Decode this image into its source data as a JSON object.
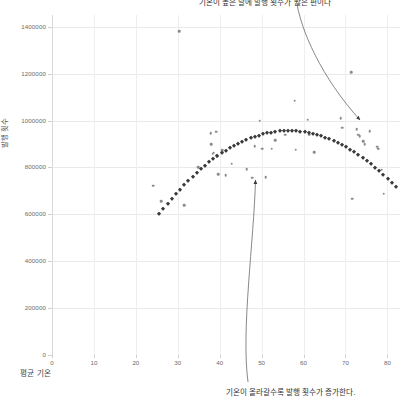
{
  "chart_data": {
    "type": "scatter",
    "title": "기온이 높은 달에 발행 횟수가 많은 편이다",
    "xlabel": "평균 기온",
    "ylabel": "발행 횟수",
    "xlim": [
      0,
      83
    ],
    "ylim": [
      0,
      1450000
    ],
    "grid": true,
    "legend": "none",
    "xticks": [
      0,
      10,
      20,
      30,
      40,
      50,
      60,
      70,
      80
    ],
    "yticks": [
      0,
      200000,
      400000,
      600000,
      800000,
      1000000,
      1200000,
      1400000
    ],
    "ytick_labels": [
      "0",
      "200000",
      "400000",
      "600000",
      "800000",
      "1000000",
      "1200000",
      "1400000"
    ],
    "xtick_labels": [
      "0",
      "10",
      "20",
      "30",
      "40",
      "50",
      "60",
      "70",
      "80"
    ],
    "series": [
      {
        "name": "관측값",
        "type": "scatter",
        "color": "#8b8b8b",
        "marker": "circle",
        "points": [
          [
            24.2,
            722000
          ],
          [
            26.0,
            655000
          ],
          [
            30.3,
            1380000
          ],
          [
            31.6,
            638000
          ],
          [
            34.8,
            800000
          ],
          [
            37.9,
            945000
          ],
          [
            38.0,
            898000
          ],
          [
            38.3,
            858000
          ],
          [
            38.6,
            862000
          ],
          [
            39.1,
            952000
          ],
          [
            39.4,
            848000
          ],
          [
            39.6,
            772000
          ],
          [
            40.6,
            874000
          ],
          [
            41.4,
            766000
          ],
          [
            42.9,
            816000
          ],
          [
            46.4,
            793000
          ],
          [
            47.8,
            756000
          ],
          [
            48.3,
            890000
          ],
          [
            49.5,
            1000000
          ],
          [
            50.2,
            880000
          ],
          [
            51.0,
            757000
          ],
          [
            52.4,
            880000
          ],
          [
            53.2,
            916000
          ],
          [
            55.6,
            940000
          ],
          [
            57.9,
            1085000
          ],
          [
            58.1,
            876000
          ],
          [
            61.0,
            1003000
          ],
          [
            61.3,
            940000
          ],
          [
            62.5,
            866000
          ],
          [
            68.9,
            1011000
          ],
          [
            69.2,
            970000
          ],
          [
            71.4,
            1205000
          ],
          [
            71.6,
            666000
          ],
          [
            72.7,
            963000
          ],
          [
            73.0,
            940000
          ],
          [
            73.4,
            932000
          ],
          [
            74.2,
            912000
          ],
          [
            74.6,
            898000
          ],
          [
            75.8,
            955000
          ],
          [
            77.6,
            888000
          ],
          [
            77.8,
            880000
          ],
          [
            78.6,
            790000
          ],
          [
            79.1,
            688000
          ]
        ]
      },
      {
        "name": "추세선 (2차 회귀)",
        "type": "quadratic-fit",
        "color": "#3a3a3a",
        "marker": "diamond",
        "vertex": [
          56.5,
          955000
        ],
        "x_start": 25.6,
        "x_end": 82.0,
        "n_markers": 58,
        "curvature": -370
      }
    ],
    "annotations": [
      {
        "name": "top-annotation",
        "text": "기온이 높은 달에 발행 횟수가 많은 편이다",
        "target_point": [
          74.0,
          965000
        ],
        "clipped_at_top": true
      },
      {
        "name": "bottom-annotation",
        "text": "기온이 올라갈수록 발행 횟수가 증가한다.",
        "target_point": [
          48.0,
          755000
        ]
      }
    ]
  },
  "colors": {
    "background": "#ffffff",
    "grid": "#e9e9e9",
    "axis": "#d8d8d8",
    "scatter": "#8b8b8b",
    "fit": "#3a3a3a",
    "tick_text": "#6b6b6b",
    "anno_text": "#333333",
    "arrow": "#555555"
  }
}
